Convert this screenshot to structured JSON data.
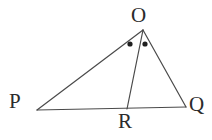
{
  "figure": {
    "kind": "geometry-diagram",
    "canvas": {
      "width": 212,
      "height": 140,
      "background": "#ffffff"
    },
    "stroke": {
      "color": "#4a4a4a",
      "width": 1.2
    },
    "label_color": "#2b2b2b",
    "vertices": [
      {
        "id": "O",
        "label": "O",
        "x": 143,
        "y": 30,
        "label_x": 131,
        "label_y": 5
      },
      {
        "id": "P",
        "label": "P",
        "x": 37,
        "y": 110,
        "label_x": 9,
        "label_y": 91
      },
      {
        "id": "Q",
        "label": "Q",
        "x": 186,
        "y": 107,
        "label_x": 189,
        "label_y": 94
      },
      {
        "id": "R",
        "label": "R",
        "x": 127,
        "y": 109,
        "label_x": 118,
        "label_y": 111
      }
    ],
    "segments": [
      {
        "id": "OP",
        "from": "O",
        "to": "P",
        "x1": 143,
        "y1": 30,
        "x2": 37,
        "y2": 110
      },
      {
        "id": "OQ",
        "from": "O",
        "to": "Q",
        "x1": 143,
        "y1": 30,
        "x2": 186,
        "y2": 107
      },
      {
        "id": "PQ",
        "from": "P",
        "to": "Q",
        "x1": 37,
        "y1": 110,
        "x2": 186,
        "y2": 107
      },
      {
        "id": "OR",
        "from": "O",
        "to": "R",
        "x1": 143,
        "y1": 30,
        "x2": 127,
        "y2": 109
      }
    ],
    "angle_marks": [
      {
        "id": "angle-POR-dot",
        "marks": "POR",
        "x": 130,
        "y": 44,
        "r": 2.6
      },
      {
        "id": "angle-ROQ-dot",
        "marks": "ROQ",
        "x": 145,
        "y": 44,
        "r": 2.6
      }
    ]
  }
}
